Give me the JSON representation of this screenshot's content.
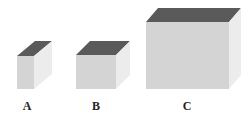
{
  "figure": {
    "colors": {
      "top": "#5a5a5a",
      "front": "#d4d4d4",
      "side": "#ececec",
      "label": "#222222"
    },
    "cubes": [
      {
        "label": "A",
        "front": {
          "x": 17,
          "y": 56,
          "w": 17,
          "h": 33
        },
        "depth": {
          "dx": 18,
          "dy": -15
        }
      },
      {
        "label": "B",
        "front": {
          "x": 76,
          "y": 55,
          "w": 40,
          "h": 34
        },
        "depth": {
          "dx": 14,
          "dy": -14
        }
      },
      {
        "label": "C",
        "front": {
          "x": 146,
          "y": 22,
          "w": 83,
          "h": 67
        },
        "depth": {
          "dx": 12,
          "dy": -14
        }
      }
    ]
  }
}
